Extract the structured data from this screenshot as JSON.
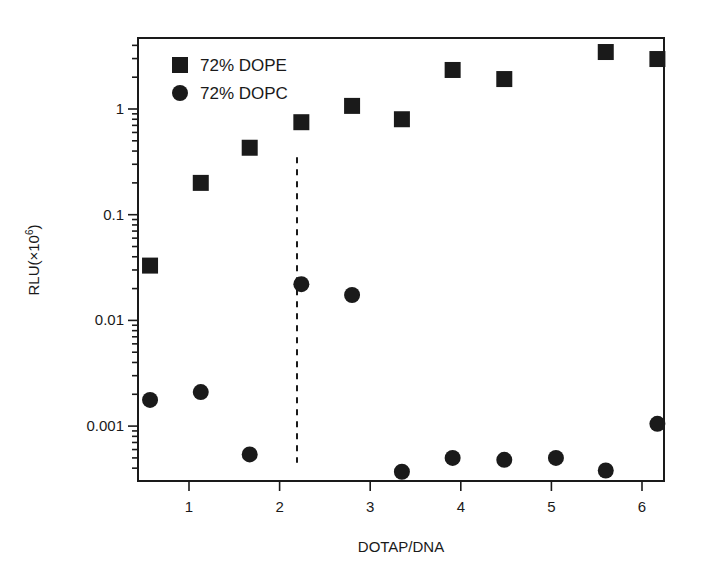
{
  "chart_data": {
    "type": "scatter",
    "title": "",
    "xlabel": "DOTAP/DNA",
    "ylabel": "RLU(×10",
    "ylabel_superscript": "6",
    "ylabel_suffix": ")",
    "yscale": "log",
    "xlim": [
      0.43,
      6.24
    ],
    "ylim": [
      0.0003,
      4.7
    ],
    "grid": false,
    "legend_position": "upper left",
    "x_ticks": [
      1,
      2,
      3,
      4,
      5,
      6
    ],
    "x_tick_labels": [
      "1",
      "2",
      "3",
      "4",
      "5",
      "6"
    ],
    "y_ticks": [
      0.001,
      0.01,
      0.1,
      1
    ],
    "y_tick_labels": [
      "0.001",
      "0.01",
      "0.1",
      "1"
    ],
    "series": [
      {
        "name": "72% DOPE",
        "marker": "square",
        "color": "#1a1a1a",
        "x": [
          0.57,
          1.13,
          1.67,
          2.24,
          2.8,
          3.35,
          3.91,
          4.48,
          5.6,
          6.17
        ],
        "y": [
          0.033,
          0.2,
          0.43,
          0.75,
          1.07,
          0.8,
          2.34,
          1.92,
          3.46,
          2.97
        ]
      },
      {
        "name": "72% DOPC",
        "marker": "circle",
        "color": "#1a1a1a",
        "x": [
          0.57,
          1.13,
          1.67,
          2.24,
          2.8,
          3.35,
          3.91,
          4.48,
          5.05,
          5.6,
          6.17
        ],
        "y": [
          0.00177,
          0.0021,
          0.00054,
          0.022,
          0.0174,
          0.00037,
          0.0005,
          0.00048,
          0.0005,
          0.00038,
          0.00105
        ]
      }
    ],
    "annotations": [
      {
        "type": "vertical-dashed-line",
        "x": 2.2,
        "y_from": 0.00045,
        "y_to": 0.35
      }
    ]
  }
}
